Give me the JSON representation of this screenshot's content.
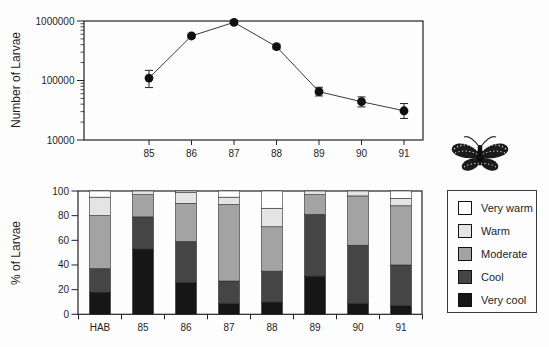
{
  "chart_data": [
    {
      "type": "line",
      "title": "",
      "xlabel": "",
      "ylabel": "Number of Larvae",
      "yscale": "log",
      "ylim": [
        10000,
        1000000
      ],
      "yticks": [
        10000,
        100000,
        1000000
      ],
      "ytick_labels": [
        "10000",
        "100000",
        "1000000"
      ],
      "x": [
        "85",
        "86",
        "87",
        "88",
        "89",
        "90",
        "91"
      ],
      "values": [
        110000,
        560000,
        950000,
        370000,
        65000,
        44000,
        31000
      ],
      "error_low": [
        76000,
        520000,
        900000,
        340000,
        55000,
        36000,
        23000
      ],
      "error_high": [
        148000,
        600000,
        1000000,
        400000,
        77000,
        53000,
        41000
      ],
      "marker": "filled-circle",
      "grid": false,
      "legend_position": "none"
    },
    {
      "type": "stacked_bar",
      "title": "",
      "xlabel": "",
      "ylabel": "% of Larvae",
      "ylim": [
        0,
        100
      ],
      "yticks": [
        0,
        20,
        40,
        60,
        80,
        100
      ],
      "categories": [
        "HAB",
        "85",
        "86",
        "87",
        "88",
        "89",
        "90",
        "91"
      ],
      "series": [
        {
          "name": "Very cool",
          "color": "#161616",
          "values": [
            18,
            53,
            26,
            9,
            10,
            31,
            9,
            7
          ]
        },
        {
          "name": "Cool",
          "color": "#454545",
          "values": [
            19,
            26,
            33,
            18,
            25,
            50,
            47,
            33
          ]
        },
        {
          "name": "Moderate",
          "color": "#a3a3a3",
          "values": [
            43,
            18,
            31,
            62,
            36,
            16,
            40,
            48
          ]
        },
        {
          "name": "Warm",
          "color": "#e4e4e4",
          "values": [
            15,
            3,
            9,
            6,
            15,
            3,
            4,
            6
          ]
        },
        {
          "name": "Very warm",
          "color": "#ffffff",
          "values": [
            5,
            0,
            1,
            5,
            14,
            0,
            0,
            6
          ]
        }
      ],
      "grid": false,
      "legend_position": "right"
    }
  ],
  "legend": {
    "items": [
      "Very warm",
      "Warm",
      "Moderate",
      "Cool",
      "Very cool"
    ]
  },
  "icons": {
    "butterfly": "butterfly-icon"
  },
  "colors": {
    "axis": "#222222",
    "marker": "#101010",
    "background": "#fdfdfd"
  }
}
